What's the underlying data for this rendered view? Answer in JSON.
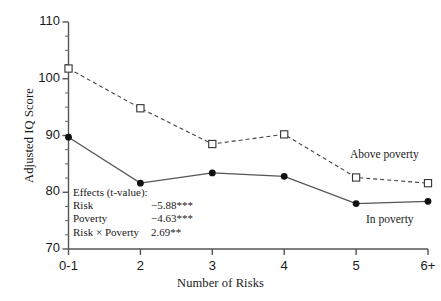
{
  "chart_data": {
    "type": "line",
    "title": "",
    "xlabel": "Number of Risks",
    "ylabel": "Adjusted IQ Score",
    "categories": [
      "0-1",
      "2",
      "3",
      "4",
      "5",
      "6+"
    ],
    "ylim": [
      70,
      110
    ],
    "yticks": [
      70,
      80,
      90,
      100,
      110
    ],
    "yminor_step": 2.5,
    "grid": false,
    "legend_position": "inline-right",
    "series": [
      {
        "name": "Above poverty",
        "values": [
          101.8,
          94.8,
          88.5,
          90.2,
          82.6,
          81.6
        ],
        "marker": "open-square",
        "linestyle": "dashed",
        "color": "#444444"
      },
      {
        "name": "In poverty",
        "values": [
          89.7,
          81.6,
          83.4,
          82.8,
          78.0,
          78.4
        ],
        "marker": "filled-circle",
        "linestyle": "solid",
        "color": "#555555"
      }
    ],
    "annotations": {
      "heading": "Effects (t-value):",
      "rows": [
        {
          "label": "Risk",
          "value": "−5.88***"
        },
        {
          "label": "Poverty",
          "value": "−4.63***"
        },
        {
          "label": "Risk × Poverty",
          "value": "2.69**"
        }
      ]
    }
  }
}
